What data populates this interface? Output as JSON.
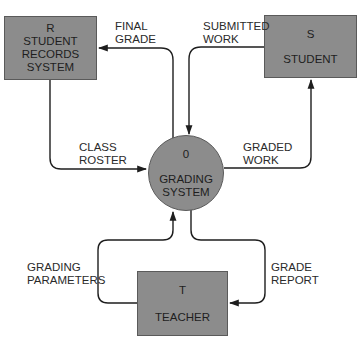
{
  "diagram": {
    "type": "data-flow-diagram (context level)",
    "colors": {
      "node_fill": "#8c8c8c",
      "node_border": "#5a5a5a",
      "line": "#1e1e1e",
      "text": "#2a2a2a",
      "background": "#ffffff"
    },
    "process": {
      "id": "0",
      "label": "GRADING\nSYSTEM",
      "line1": "GRADING",
      "line2": "SYSTEM"
    },
    "entities": {
      "r": {
        "id": "R",
        "label": "STUDENT\nRECORDS\nSYSTEM",
        "line1": "STUDENT",
        "line2": "RECORDS",
        "line3": "SYSTEM"
      },
      "s": {
        "id": "S",
        "label": "STUDENT"
      },
      "t": {
        "id": "T",
        "label": "TEACHER"
      }
    },
    "flows": {
      "final_grade": {
        "label": "FINAL\nGRADE",
        "from": "0",
        "to": "R"
      },
      "submitted_work": {
        "label": "SUBMITTED\nWORK",
        "from": "S",
        "to": "0"
      },
      "class_roster": {
        "label": "CLASS\nROSTER",
        "from": "R",
        "to": "0"
      },
      "graded_work": {
        "label": "GRADED\nWORK",
        "from": "0",
        "to": "S"
      },
      "grading_parameters": {
        "label": "GRADING\nPARAMETERS",
        "from": "T",
        "to": "0"
      },
      "grade_report": {
        "label": "GRADE\nREPORT",
        "from": "0",
        "to": "T"
      }
    }
  }
}
